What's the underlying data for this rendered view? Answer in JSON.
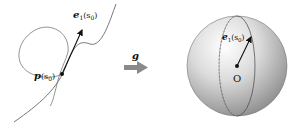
{
  "left_panel": {
    "point_label": "p(s₀)",
    "point_label_main": "p",
    "point_label_arg": "(s",
    "point_label_sub": "0",
    "point_label_close": ")",
    "vector_label_main": "e",
    "vector_label_sub1": "1",
    "vector_label_arg": "(s",
    "vector_label_sub0": "0",
    "vector_label_close": ")"
  },
  "arrow": {
    "label": "g",
    "color": "#8a8a8a"
  },
  "right_panel": {
    "origin_label": "O",
    "vector_label_main": "e",
    "vector_label_sub1": "1",
    "vector_label_arg": "(s",
    "vector_label_sub0": "0",
    "vector_label_close": ")"
  }
}
